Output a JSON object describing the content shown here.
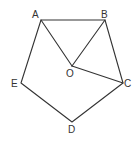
{
  "diagram": {
    "type": "geometry-figure",
    "stroke_color": "#333333",
    "background": "#ffffff",
    "points": {
      "A": {
        "label": "A",
        "x": 41,
        "y": 20
      },
      "B": {
        "label": "B",
        "x": 105,
        "y": 20
      },
      "C": {
        "label": "C",
        "x": 123,
        "y": 83
      },
      "D": {
        "label": "D",
        "x": 72,
        "y": 122
      },
      "E": {
        "label": "E",
        "x": 21,
        "y": 83
      },
      "O": {
        "label": "O",
        "x": 72,
        "y": 66
      }
    },
    "segments": [
      [
        "A",
        "B"
      ],
      [
        "B",
        "C"
      ],
      [
        "C",
        "D"
      ],
      [
        "D",
        "E"
      ],
      [
        "E",
        "A"
      ],
      [
        "A",
        "O"
      ],
      [
        "B",
        "O"
      ],
      [
        "O",
        "C"
      ]
    ]
  }
}
